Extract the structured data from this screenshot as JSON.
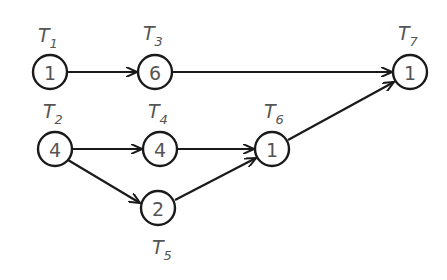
{
  "diagram": {
    "type": "task-dependency-graph",
    "nodes": [
      {
        "id": "T1",
        "label": "T",
        "sub": "1",
        "value": "1",
        "x": 50,
        "y": 72
      },
      {
        "id": "T3",
        "label": "T",
        "sub": "3",
        "value": "6",
        "x": 155,
        "y": 72
      },
      {
        "id": "T7",
        "label": "T",
        "sub": "7",
        "value": "1",
        "x": 410,
        "y": 72
      },
      {
        "id": "T2",
        "label": "T",
        "sub": "2",
        "value": "4",
        "x": 55,
        "y": 149
      },
      {
        "id": "T4",
        "label": "T",
        "sub": "4",
        "value": "4",
        "x": 160,
        "y": 149
      },
      {
        "id": "T6",
        "label": "T",
        "sub": "6",
        "value": "1",
        "x": 272,
        "y": 149
      },
      {
        "id": "T5",
        "label": "T",
        "sub": "5",
        "value": "2",
        "x": 158,
        "y": 208
      }
    ],
    "edges": [
      {
        "from": "T1",
        "to": "T3"
      },
      {
        "from": "T3",
        "to": "T7"
      },
      {
        "from": "T2",
        "to": "T4"
      },
      {
        "from": "T2",
        "to": "T5"
      },
      {
        "from": "T4",
        "to": "T6"
      },
      {
        "from": "T5",
        "to": "T6"
      },
      {
        "from": "T6",
        "to": "T7"
      }
    ]
  }
}
